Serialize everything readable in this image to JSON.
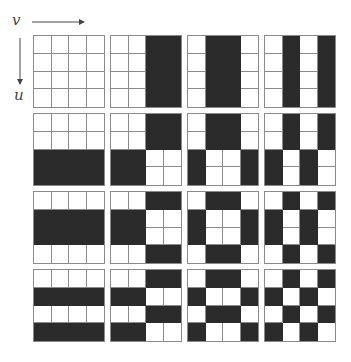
{
  "axes": {
    "horizontal_label": "v",
    "vertical_label": "u"
  },
  "colors": {
    "positive": "#ffffff",
    "negative": "#2b2b2b",
    "grid_line": "#8a8a8a"
  },
  "layout": {
    "blocks_per_side": 4,
    "cells_per_side": 4,
    "block_pitch_x": 77,
    "block_pitch_y": 78
  },
  "basis": {
    "description": "2D Walsh-Hadamard basis functions (sequency order), black = -1, white = +1",
    "walsh_1d": [
      [
        0,
        0,
        0,
        0
      ],
      [
        0,
        0,
        1,
        1
      ],
      [
        0,
        1,
        1,
        0
      ],
      [
        0,
        1,
        0,
        1
      ]
    ]
  }
}
